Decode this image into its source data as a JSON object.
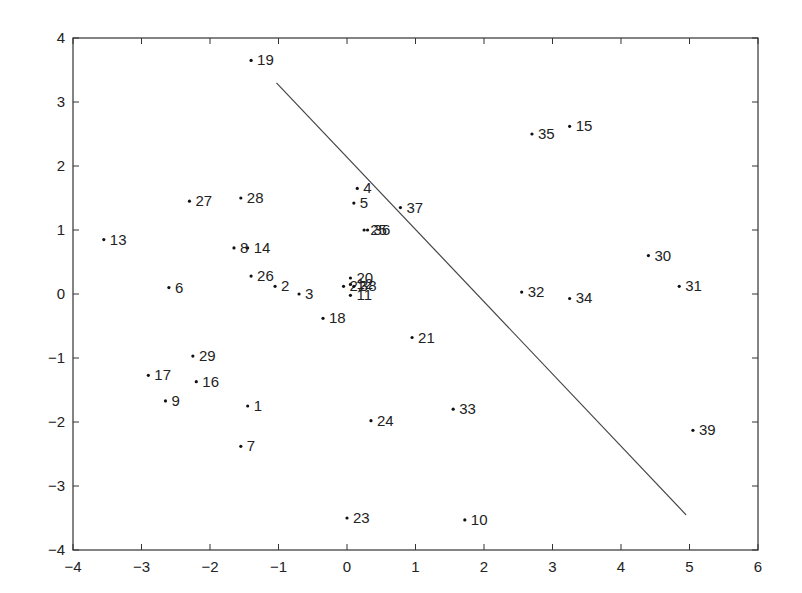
{
  "chart_data": {
    "type": "scatter",
    "title": "",
    "xlabel": "",
    "ylabel": "",
    "xlim": [
      -4,
      6
    ],
    "ylim": [
      -4,
      4
    ],
    "grid": false,
    "legend": null,
    "xticks": [
      -4,
      -3,
      -2,
      -1,
      0,
      1,
      2,
      3,
      4,
      5,
      6
    ],
    "yticks": [
      -4,
      -3,
      -2,
      -1,
      0,
      1,
      2,
      3,
      4
    ],
    "points": [
      {
        "label": "1",
        "x": -1.45,
        "y": -1.75
      },
      {
        "label": "2",
        "x": -1.05,
        "y": 0.12
      },
      {
        "label": "3",
        "x": -0.7,
        "y": 0.0
      },
      {
        "label": "4",
        "x": 0.15,
        "y": 1.65
      },
      {
        "label": "5",
        "x": 0.1,
        "y": 1.42
      },
      {
        "label": "6",
        "x": -2.6,
        "y": 0.1
      },
      {
        "label": "7",
        "x": -1.55,
        "y": -2.38
      },
      {
        "label": "8",
        "x": -1.65,
        "y": 0.72
      },
      {
        "label": "9",
        "x": -2.65,
        "y": -1.67
      },
      {
        "label": "10",
        "x": 1.72,
        "y": -3.53
      },
      {
        "label": "11",
        "x": 0.05,
        "y": -0.02
      },
      {
        "label": "12",
        "x": 0.05,
        "y": 0.15
      },
      {
        "label": "13",
        "x": -3.55,
        "y": 0.85
      },
      {
        "label": "14",
        "x": -1.45,
        "y": 0.72
      },
      {
        "label": "15",
        "x": 3.25,
        "y": 2.62
      },
      {
        "label": "16",
        "x": -2.2,
        "y": -1.37
      },
      {
        "label": "17",
        "x": -2.9,
        "y": -1.27
      },
      {
        "label": "18",
        "x": -0.35,
        "y": -0.38
      },
      {
        "label": "19",
        "x": -1.4,
        "y": 3.65
      },
      {
        "label": "20",
        "x": 0.05,
        "y": 0.25
      },
      {
        "label": "21",
        "x": 0.95,
        "y": -0.68
      },
      {
        "label": "22",
        "x": -0.05,
        "y": 0.12
      },
      {
        "label": "23",
        "x": 0.0,
        "y": -3.5
      },
      {
        "label": "24",
        "x": 0.35,
        "y": -1.98
      },
      {
        "label": "25",
        "x": 0.25,
        "y": 1.0
      },
      {
        "label": "26",
        "x": -1.4,
        "y": 0.28
      },
      {
        "label": "27",
        "x": -2.3,
        "y": 1.45
      },
      {
        "label": "28",
        "x": -1.55,
        "y": 1.5
      },
      {
        "label": "29",
        "x": -2.25,
        "y": -0.97
      },
      {
        "label": "30",
        "x": 4.4,
        "y": 0.6
      },
      {
        "label": "31",
        "x": 4.85,
        "y": 0.12
      },
      {
        "label": "32",
        "x": 2.55,
        "y": 0.03
      },
      {
        "label": "33",
        "x": 1.55,
        "y": -1.8
      },
      {
        "label": "34",
        "x": 3.25,
        "y": -0.07
      },
      {
        "label": "35",
        "x": 2.7,
        "y": 2.5
      },
      {
        "label": "36",
        "x": 0.3,
        "y": 1.0
      },
      {
        "label": "37",
        "x": 0.78,
        "y": 1.35
      },
      {
        "label": "38",
        "x": 0.1,
        "y": 0.12
      },
      {
        "label": "39",
        "x": 5.05,
        "y": -2.13
      }
    ],
    "line": {
      "x": [
        -1.03,
        4.95
      ],
      "y": [
        3.3,
        -3.45
      ]
    }
  },
  "colors": {
    "axis": "#333333",
    "point": "#111111",
    "line": "#444444",
    "background": "#ffffff"
  }
}
